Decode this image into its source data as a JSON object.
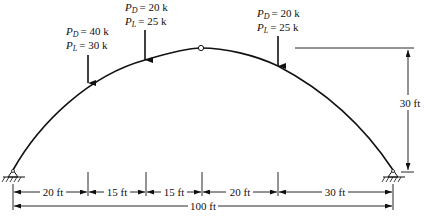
{
  "diagram": {
    "type": "three-hinged arch",
    "loads": [
      {
        "id": "load-1",
        "pd_label": "P",
        "pd_sub": "D",
        "pd_value": "= 40 k",
        "pl_label": "P",
        "pl_sub": "L",
        "pl_value": "= 30 k"
      },
      {
        "id": "load-2",
        "pd_label": "P",
        "pd_sub": "D",
        "pd_value": "= 20 k",
        "pl_label": "P",
        "pl_sub": "L",
        "pl_value": "= 25 k"
      },
      {
        "id": "load-3",
        "pd_label": "P",
        "pd_sub": "D",
        "pd_value": "= 20 k",
        "pl_label": "P",
        "pl_sub": "L",
        "pl_value": "= 25 k"
      }
    ],
    "dimensions": {
      "segments": [
        "20 ft",
        "15 ft",
        "15 ft",
        "20 ft",
        "30 ft"
      ],
      "total": "100 ft",
      "height": "30 ft"
    },
    "supports": [
      "pin-left",
      "pin-right"
    ],
    "hinge": "crown-hinge",
    "colors": {
      "line": "#111111",
      "background": "#ffffff"
    }
  }
}
